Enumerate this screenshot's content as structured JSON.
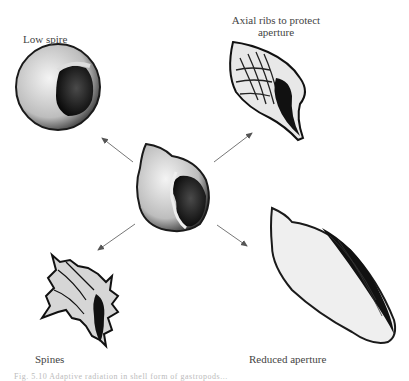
{
  "figure": {
    "center_shell": {
      "name": "Ancestral globose shell"
    },
    "labels": {
      "top_left": "Low spire",
      "top_right_line1": "Axial ribs to protect",
      "top_right_line2": "aperture",
      "bottom_left": "Spines",
      "bottom_right": "Reduced aperture"
    },
    "caption": "Fig. 5.10 Adaptive radiation in shell form of gastropods..."
  },
  "colors": {
    "ink": "#1a1a1a",
    "arrow": "#777777",
    "text": "#444444",
    "background": "#ffffff"
  }
}
